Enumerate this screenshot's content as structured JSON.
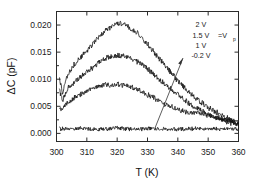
{
  "chart_data": {
    "type": "line",
    "title": "",
    "xlabel": "T (K)",
    "ylabel": "ΔC (pF)",
    "xlim": [
      300,
      360
    ],
    "ylim": [
      -0.0015,
      0.0225
    ],
    "xticks": [
      300,
      310,
      320,
      330,
      340,
      350,
      360
    ],
    "xticklabels": [
      "300",
      "310",
      "320",
      "330",
      "340",
      "350",
      "360"
    ],
    "yticks": [
      0.0,
      0.005,
      0.01,
      0.015,
      0.02
    ],
    "yticklabels": [
      "0.000",
      "0.005",
      "0.010",
      "0.015",
      "0.020"
    ],
    "grid": false,
    "legend_position": "upper-right-inside",
    "noise_amplitude": 0.00045,
    "series": [
      {
        "name": "2 V",
        "label": "2 V",
        "color": "#111111",
        "x": [
          301,
          302,
          303,
          304,
          306,
          308,
          310,
          312,
          314,
          316,
          318,
          320,
          321,
          322,
          324,
          326,
          328,
          330,
          332,
          334,
          336,
          338,
          340,
          342,
          344,
          346,
          348,
          350,
          352,
          354,
          356,
          358,
          360
        ],
        "y": [
          0.0103,
          0.0075,
          0.0098,
          0.0112,
          0.0128,
          0.0141,
          0.0152,
          0.0165,
          0.0178,
          0.0189,
          0.0197,
          0.0202,
          0.0203,
          0.0201,
          0.0196,
          0.0188,
          0.0177,
          0.0165,
          0.0152,
          0.0138,
          0.0124,
          0.011,
          0.0097,
          0.0085,
          0.0074,
          0.0064,
          0.0056,
          0.0048,
          0.0041,
          0.0035,
          0.0029,
          0.0024,
          0.0019
        ]
      },
      {
        "name": "1.5 V",
        "label": "1.5 V",
        "color": "#111111",
        "x": [
          301,
          302,
          303,
          304,
          306,
          308,
          310,
          312,
          314,
          316,
          318,
          320,
          321,
          322,
          324,
          326,
          328,
          330,
          332,
          334,
          336,
          338,
          340,
          342,
          344,
          346,
          348,
          350,
          352,
          354,
          356,
          358,
          360
        ],
        "y": [
          0.0079,
          0.006,
          0.0074,
          0.0085,
          0.0096,
          0.0105,
          0.0114,
          0.0122,
          0.0131,
          0.0138,
          0.0142,
          0.0144,
          0.0144,
          0.0143,
          0.014,
          0.0135,
          0.0128,
          0.0119,
          0.011,
          0.01,
          0.009,
          0.008,
          0.0071,
          0.0062,
          0.0054,
          0.0047,
          0.0041,
          0.0035,
          0.003,
          0.0026,
          0.0022,
          0.0019,
          0.0016
        ]
      },
      {
        "name": "1 V",
        "label": "1 V",
        "color": "#111111",
        "x": [
          301,
          302,
          303,
          304,
          306,
          308,
          310,
          312,
          314,
          316,
          318,
          320,
          321,
          322,
          324,
          326,
          328,
          330,
          332,
          334,
          336,
          338,
          340,
          342,
          344,
          346,
          348,
          350,
          352,
          354,
          356,
          358,
          360
        ],
        "y": [
          0.005,
          0.0042,
          0.0052,
          0.0059,
          0.0066,
          0.0072,
          0.0078,
          0.0083,
          0.0087,
          0.0089,
          0.009,
          0.009,
          0.0089,
          0.0088,
          0.0086,
          0.0082,
          0.0078,
          0.0072,
          0.0066,
          0.006,
          0.0054,
          0.0049,
          0.0044,
          0.004,
          0.0038,
          0.0037,
          0.0036,
          0.0034,
          0.0031,
          0.0028,
          0.0025,
          0.0022,
          0.0018
        ]
      },
      {
        "name": "-0.2 V",
        "label": "-0.2 V",
        "color": "#111111",
        "x": [
          301,
          304,
          308,
          312,
          316,
          320,
          324,
          328,
          332,
          336,
          340,
          344,
          348,
          352,
          356,
          360
        ],
        "y": [
          0.0008,
          0.0008,
          0.0009,
          0.0008,
          0.0008,
          0.0009,
          0.0008,
          0.0008,
          0.0009,
          0.0008,
          0.0008,
          0.0008,
          0.0009,
          0.0008,
          0.0008,
          0.0008
        ]
      }
    ],
    "annotations": [
      {
        "name": "legend-entry-0",
        "text": "2 V"
      },
      {
        "name": "legend-entry-1",
        "text": "1.5 V"
      },
      {
        "name": "legend-entry-2",
        "text": "1 V"
      },
      {
        "name": "legend-entry-3",
        "text": "-0.2 V"
      },
      {
        "name": "legend-equals-vp",
        "text": "=V"
      },
      {
        "name": "legend-vp-subscript",
        "text": "p"
      },
      {
        "name": "direction-arrow",
        "text": ""
      }
    ]
  },
  "legend": {
    "entry_2v": "2 V",
    "entry_15v": "1.5 V",
    "entry_1v": "1 V",
    "entry_m02v": "-0.2 V",
    "equals_v": "=V",
    "subscript_p": "p"
  },
  "axes": {
    "xlabel": "T (K)",
    "ylabel_delta": "ΔC (pF)",
    "xtick_0": "300",
    "xtick_1": "310",
    "xtick_2": "320",
    "xtick_3": "330",
    "xtick_4": "340",
    "xtick_5": "350",
    "xtick_6": "360",
    "ytick_0": "0.000",
    "ytick_1": "0.005",
    "ytick_2": "0.010",
    "ytick_3": "0.015",
    "ytick_4": "0.020"
  }
}
